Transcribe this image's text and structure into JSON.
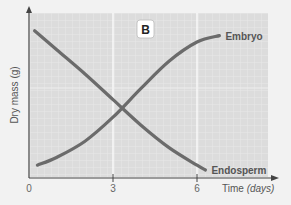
{
  "chart_data": {
    "type": "line",
    "title": "",
    "panel_label": "B",
    "xlabel": "Time",
    "xlabel_unit": "(days)",
    "ylabel": "Dry mass (g)",
    "xlim": [
      0,
      8.5
    ],
    "ylim": [
      0,
      10
    ],
    "x_ticks": [
      0,
      3,
      6
    ],
    "y_ticks": [],
    "grid": true,
    "legend": "inline labels at line ends",
    "series": [
      {
        "name": "Embryo",
        "color": "#6b6b6b",
        "x": [
          0.3,
          1,
          2,
          3,
          4,
          5,
          6,
          6.8
        ],
        "y": [
          0.8,
          1.3,
          2.3,
          3.8,
          5.6,
          7.3,
          8.5,
          8.9
        ]
      },
      {
        "name": "Endosperm",
        "color": "#6b6b6b",
        "x": [
          0.2,
          1,
          2,
          3,
          4,
          5,
          6,
          6.3
        ],
        "y": [
          9.2,
          8.0,
          6.5,
          4.9,
          3.3,
          1.9,
          0.8,
          0.5
        ]
      }
    ]
  },
  "colors": {
    "background": "#f2f2f2",
    "plot_area": "#dedede",
    "gridline": "#ececec",
    "major_gridline": "#ffffff",
    "axis": "#444444",
    "line": "#6b6b6b"
  }
}
